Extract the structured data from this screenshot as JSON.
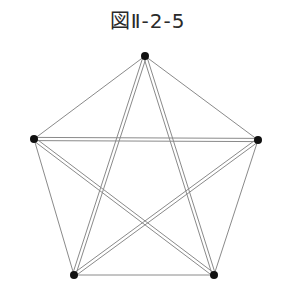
{
  "figure": {
    "title": "図Ⅱ-2-5"
  },
  "diagram": {
    "type": "complete-graph-K5",
    "vertices": [
      {
        "id": "top",
        "x": 145,
        "y": 56
      },
      {
        "id": "right",
        "x": 258,
        "y": 140
      },
      {
        "id": "bottom-right",
        "x": 214,
        "y": 275
      },
      {
        "id": "bottom-left",
        "x": 74,
        "y": 275
      },
      {
        "id": "left",
        "x": 34,
        "y": 139
      }
    ],
    "edges": [
      {
        "from": "top",
        "to": "right",
        "style": "single"
      },
      {
        "from": "right",
        "to": "bottom-right",
        "style": "single"
      },
      {
        "from": "bottom-right",
        "to": "bottom-left",
        "style": "single"
      },
      {
        "from": "bottom-left",
        "to": "left",
        "style": "single"
      },
      {
        "from": "left",
        "to": "top",
        "style": "single"
      },
      {
        "from": "top",
        "to": "bottom-left",
        "style": "double"
      },
      {
        "from": "top",
        "to": "bottom-right",
        "style": "double"
      },
      {
        "from": "left",
        "to": "right",
        "style": "double"
      },
      {
        "from": "left",
        "to": "bottom-right",
        "style": "double"
      },
      {
        "from": "right",
        "to": "bottom-left",
        "style": "double"
      }
    ],
    "colors": {
      "line": "#8a8a8a",
      "vertex": "#111111",
      "title": "#2a2a2a"
    }
  }
}
